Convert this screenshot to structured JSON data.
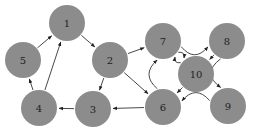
{
  "diagram": {
    "type": "directed-graph",
    "node_color": "#8c8c8c",
    "edge_color": "#333333",
    "node_radius": 18,
    "nodes": [
      {
        "id": "1",
        "label": "1",
        "x": 67,
        "y": 23
      },
      {
        "id": "2",
        "label": "2",
        "x": 110,
        "y": 60
      },
      {
        "id": "3",
        "label": "3",
        "x": 93,
        "y": 109
      },
      {
        "id": "4",
        "label": "4",
        "x": 39,
        "y": 108
      },
      {
        "id": "5",
        "label": "5",
        "x": 23,
        "y": 60
      },
      {
        "id": "6",
        "label": "6",
        "x": 163,
        "y": 107
      },
      {
        "id": "7",
        "label": "7",
        "x": 163,
        "y": 41
      },
      {
        "id": "8",
        "label": "8",
        "x": 227,
        "y": 41
      },
      {
        "id": "9",
        "label": "9",
        "x": 228,
        "y": 106
      },
      {
        "id": "10",
        "label": "10",
        "x": 196,
        "y": 74
      }
    ],
    "edges": [
      {
        "from": "5",
        "to": "1",
        "curve": 0
      },
      {
        "from": "1",
        "to": "2",
        "curve": 0
      },
      {
        "from": "4",
        "to": "5",
        "curve": 0
      },
      {
        "from": "4",
        "to": "1",
        "curve": 0
      },
      {
        "from": "2",
        "to": "3",
        "curve": 0
      },
      {
        "from": "2",
        "to": "7",
        "curve": 0
      },
      {
        "from": "2",
        "to": "6",
        "curve": 0
      },
      {
        "from": "3",
        "to": "4",
        "curve": 0
      },
      {
        "from": "6",
        "to": "3",
        "curve": 0
      },
      {
        "from": "6",
        "to": "7",
        "curve": 0.25
      },
      {
        "from": "7",
        "to": "10",
        "curve": 0.12
      },
      {
        "from": "10",
        "to": "7",
        "curve": 0.12
      },
      {
        "from": "7",
        "to": "8",
        "curve": -0.25
      },
      {
        "from": "8",
        "to": "10",
        "curve": 0
      },
      {
        "from": "8",
        "to": "9",
        "curve": -0.3
      },
      {
        "from": "9",
        "to": "6",
        "curve": -0.25
      },
      {
        "from": "10",
        "to": "6",
        "curve": 0
      }
    ]
  }
}
